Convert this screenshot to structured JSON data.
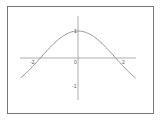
{
  "chart_data": {
    "type": "line",
    "title": "",
    "xlabel": "",
    "ylabel": "",
    "function": "cos(x)",
    "xlim": [
      -2.5,
      2.5
    ],
    "ylim": [
      -1.5,
      1.2
    ],
    "x_ticks": [
      "-2",
      "0",
      "2"
    ],
    "y_ticks": [
      "1",
      "-1"
    ],
    "series": [
      {
        "name": "cos(x)",
        "x": [
          -2.5,
          -2,
          -1.5,
          -1,
          -0.5,
          0,
          0.5,
          1,
          1.5,
          2,
          2.5
        ],
        "values": [
          -0.8,
          -0.42,
          0.07,
          0.54,
          0.88,
          1,
          0.88,
          0.54,
          0.07,
          -0.42,
          -0.8
        ]
      }
    ],
    "grid": false,
    "legend": "none",
    "color": "#888888"
  },
  "labels": {
    "x_neg2": "-2",
    "x_0": "0",
    "x_2": "2",
    "y_1": "1",
    "y_neg1": "-1"
  }
}
